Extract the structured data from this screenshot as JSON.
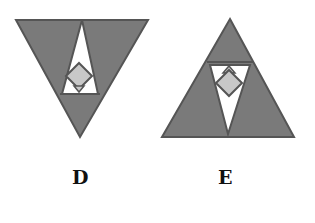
{
  "figures": [
    {
      "label": "D",
      "description": "Inverted gray triangle containing a white upright triangle with a gray diamond",
      "colors": {
        "fill": "#7a7a7a",
        "inner": "#ffffff",
        "diamond": "#c8c8c8",
        "stroke": "#555555"
      }
    },
    {
      "label": "E",
      "description": "Upright gray triangle containing a white inverted triangle with a gray diamond",
      "colors": {
        "fill": "#7a7a7a",
        "inner": "#ffffff",
        "diamond": "#c8c8c8",
        "stroke": "#555555"
      }
    }
  ]
}
